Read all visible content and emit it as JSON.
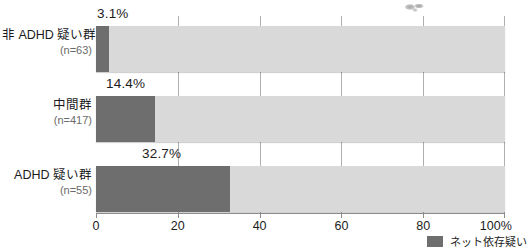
{
  "chart_data": {
    "type": "bar",
    "orientation": "horizontal",
    "stacked": true,
    "title": "",
    "subtitle": "",
    "xlabel": "",
    "ylabel": "",
    "xlim": [
      0,
      100
    ],
    "xticks": [
      0,
      20,
      40,
      60,
      80,
      100
    ],
    "xtick_labels": [
      "0",
      "20",
      "40",
      "60",
      "80",
      "100%"
    ],
    "grid": true,
    "legend_position": "bottom-right",
    "categories": [
      "非 ADHD 疑い群",
      "中間群",
      "ADHD 疑い群"
    ],
    "category_n": [
      "(n=63)",
      "(n=417)",
      "(n=55)"
    ],
    "series": [
      {
        "name": "ネット依存疑い",
        "color": "#6e6e6e",
        "values": [
          3.1,
          14.4,
          32.7
        ],
        "value_labels": [
          "3.1%",
          "14.4%",
          "32.7%"
        ]
      },
      {
        "name": "",
        "color": "#d9d9d9",
        "values": [
          96.9,
          85.6,
          67.3
        ],
        "value_labels": [
          "",
          "",
          ""
        ]
      }
    ],
    "legend": [
      {
        "label": "ネット依存疑い",
        "color": "#6e6e6e"
      }
    ]
  },
  "colors": {
    "fill": "#6e6e6e",
    "track": "#d9d9d9",
    "axis": "#8c8c8c",
    "grid": "#b0b0b0",
    "text": "#1c1c1c",
    "muted_text": "#6a6a6a"
  }
}
